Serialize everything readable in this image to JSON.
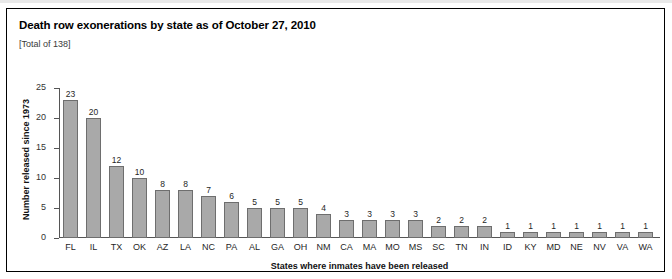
{
  "figure": {
    "title": "Death row exonerations by state as of October 27, 2010",
    "subtitle": "[Total of 138]",
    "border_color": "#000000",
    "background": "#ffffff"
  },
  "chart_data": {
    "type": "bar",
    "title": "Death row exonerations by state as of October 27, 2010",
    "subtitle": "[Total of 138]",
    "xlabel": "States where inmates have been released",
    "ylabel": "Number released since 1973",
    "ylim": [
      0,
      25
    ],
    "yticks": [
      0,
      5,
      10,
      15,
      20,
      25
    ],
    "ytick_labels": [
      "0",
      "5",
      "10",
      "15",
      "20",
      "25"
    ],
    "grid": false,
    "legend": null,
    "bar_color": "#a9a9a9",
    "bar_edge_color": "#6e6e6e",
    "show_value_labels": true,
    "total": 138,
    "categories": [
      "FL",
      "IL",
      "TX",
      "OK",
      "AZ",
      "LA",
      "NC",
      "PA",
      "AL",
      "GA",
      "OH",
      "NM",
      "CA",
      "MA",
      "MO",
      "MS",
      "SC",
      "TN",
      "IN",
      "ID",
      "KY",
      "MD",
      "NE",
      "NV",
      "VA",
      "WA"
    ],
    "values": [
      23,
      20,
      12,
      10,
      8,
      8,
      7,
      6,
      5,
      5,
      5,
      4,
      3,
      3,
      3,
      3,
      2,
      2,
      2,
      1,
      1,
      1,
      1,
      1,
      1,
      1
    ],
    "value_labels": [
      "23",
      "20",
      "12",
      "10",
      "8",
      "8",
      "7",
      "6",
      "5",
      "5",
      "5",
      "4",
      "3",
      "3",
      "3",
      "3",
      "2",
      "2",
      "2",
      "1",
      "1",
      "1",
      "1",
      "1",
      "1",
      "1"
    ]
  }
}
